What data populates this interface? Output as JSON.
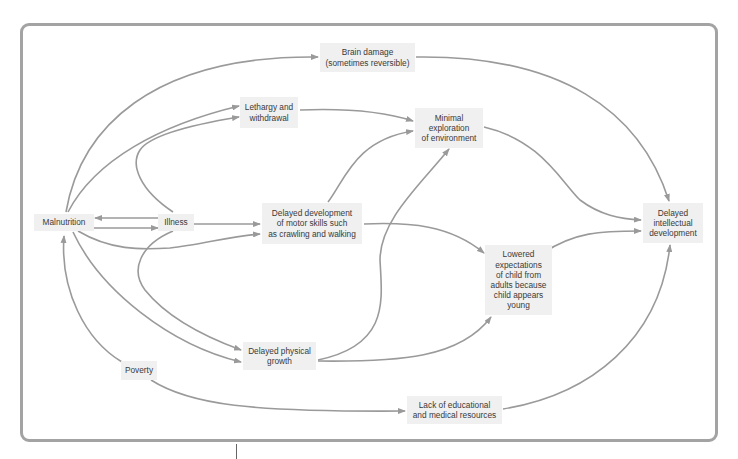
{
  "diagram": {
    "colors": {
      "frame": "#a3a3a3",
      "edge": "#9a9a9a",
      "node_bg": "#f0f0f0",
      "text": "#3a3a3a"
    },
    "nodes": {
      "malnutrition": {
        "lines": [
          "Malnutrition"
        ]
      },
      "illness": {
        "lines": [
          "Illness"
        ]
      },
      "brain_damage": {
        "lines": [
          "Brain damage",
          "(sometimes reversible)"
        ]
      },
      "lethargy": {
        "lines": [
          "Lethargy and",
          "withdrawal"
        ]
      },
      "minimal_exploration": {
        "lines": [
          "Minimal",
          "exploration",
          "of environment"
        ]
      },
      "motor_skills": {
        "lines": [
          "Delayed development",
          "of motor skills such",
          "as crawling and walking"
        ]
      },
      "lowered_expectations": {
        "lines": [
          "Lowered",
          "expectations",
          "of child from",
          "adults because",
          "child appears",
          "young"
        ]
      },
      "intellectual": {
        "lines": [
          "Delayed",
          "intellectual",
          "development"
        ]
      },
      "physical_growth": {
        "lines": [
          "Delayed physical",
          "growth"
        ]
      },
      "poverty": {
        "lines": [
          "Poverty"
        ]
      },
      "lack_resources": {
        "lines": [
          "Lack of educational",
          "and medical resources"
        ]
      }
    },
    "edges": [
      {
        "from": "malnutrition",
        "to": "brain_damage"
      },
      {
        "from": "malnutrition",
        "to": "lethargy"
      },
      {
        "from": "illness",
        "to": "lethargy"
      },
      {
        "from": "illness",
        "to": "malnutrition"
      },
      {
        "from": "malnutrition",
        "to": "illness"
      },
      {
        "from": "illness",
        "to": "motor_skills"
      },
      {
        "from": "malnutrition",
        "to": "motor_skills"
      },
      {
        "from": "malnutrition",
        "to": "physical_growth"
      },
      {
        "from": "illness",
        "to": "physical_growth"
      },
      {
        "from": "poverty",
        "to": "malnutrition"
      },
      {
        "from": "poverty",
        "to": "lack_resources"
      },
      {
        "from": "brain_damage",
        "to": "intellectual"
      },
      {
        "from": "lethargy",
        "to": "minimal_exploration"
      },
      {
        "from": "motor_skills",
        "to": "minimal_exploration"
      },
      {
        "from": "physical_growth",
        "to": "minimal_exploration"
      },
      {
        "from": "motor_skills",
        "to": "lowered_expectations"
      },
      {
        "from": "physical_growth",
        "to": "lowered_expectations"
      },
      {
        "from": "minimal_exploration",
        "to": "intellectual"
      },
      {
        "from": "lowered_expectations",
        "to": "intellectual"
      },
      {
        "from": "lack_resources",
        "to": "intellectual"
      }
    ]
  }
}
